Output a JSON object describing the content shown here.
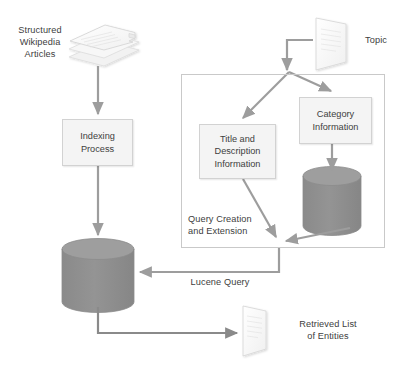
{
  "diagram": {
    "nodes": {
      "structured_wikipedia_articles": "Structured\nWikipedia\nArticles",
      "indexing_process": "Indexing\nProcess",
      "structured_lucene_index": "Structured\nLucene\nIndex",
      "topic": "Topic",
      "title_and_description_information": "Title and\nDescription\nInformation",
      "category_information": "Category\nInformation",
      "yago": "YAGO",
      "query_creation_and_extension": "Query Creation\nand Extension",
      "retrieved_list_of_entities": "Retrieved List\nof Entities"
    },
    "edges": {
      "lucene_query": "Lucene Query"
    },
    "colors": {
      "text": "#404040",
      "box_fill": "#f4f4f4",
      "box_border": "#d2d2d2",
      "group_border": "#c9c9c9",
      "cylinder_body": "#8c8c8c",
      "cylinder_top": "#9a9a9a",
      "cylinder_text": "#ffffff",
      "arrow": "#9d9d9d",
      "arrow_dark": "#8a8a8a",
      "doc_fill": "#fbfbfb",
      "doc_border": "#d8d8d8",
      "canvas": "#ffffff"
    }
  }
}
